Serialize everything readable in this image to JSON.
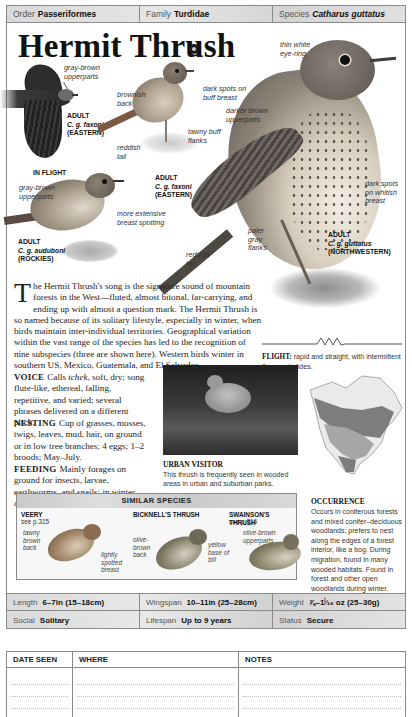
{
  "taxonomy": {
    "order_label": "Order",
    "order_value": "Passeriformes",
    "family_label": "Family",
    "family_value": "Turdidae",
    "species_label": "Species",
    "species_value": "Catharus guttatus"
  },
  "title": "Hermit Thrush",
  "audio_icon": "audio-speaker-icon",
  "illustrations": {
    "flying": {
      "annotations": [
        "gray-brown upperparts"
      ],
      "caption_line1": "ADULT",
      "caption_line2": "C. g. faxoni",
      "caption_line3": "(EASTERN)",
      "label": "IN FLIGHT"
    },
    "faxoni_adult": {
      "annotations": [
        "brownish back",
        "dark spots on buff breast",
        "tawny buff flanks",
        "reddish tail"
      ],
      "caption_line1": "ADULT",
      "caption_line2": "C. g. faxoni",
      "caption_line3": "(EASTERN)"
    },
    "auduboni_adult": {
      "annotations": [
        "gray-brown upperparts",
        "more extensive breast spotting"
      ],
      "caption_line1": "ADULT",
      "caption_line2": "C. g. auduboni",
      "caption_line3": "(ROCKIES)"
    },
    "guttatus_adult": {
      "annotations": [
        "thin white eye-ring",
        "darker brown upperparts",
        "dark spots on whitish breast",
        "paler gray flanks",
        "reddish tail"
      ],
      "caption_line1": "ADULT",
      "caption_line2": "C. g. guttatus",
      "caption_line3": "(NORTHWESTERN)"
    }
  },
  "description": {
    "dropcap": "T",
    "text": "he Hermit Thrush's song is the signature sound of mountain forests in the West—fluted, almost bitonal, far-carrying, and ending up with almost a question mark. The Hermit Thrush is so named because of its solitary lifestyle, especially in winter, when birds maintain inter-individual territories. Geographical variation within the vast range of the species has led to the recognition of nine subspecies (three are shown here). Western birds winter in southern US, Mexico, Guatemala, and El Salvador."
  },
  "sections": {
    "voice": {
      "heading": "VOICE",
      "text_pre": "Calls ",
      "text_em": "tchek",
      "text_post": ", soft, dry; song flute-like, ethereal, falling, repetitive, and varied; several phrases delivered on a different pitch."
    },
    "nesting": {
      "heading": "NESTING",
      "text": "Cup of grasses, mosses, twigs, leaves, mud, hair, on ground or in low tree branches; 4 eggs; 1–2 broods; May–July."
    },
    "feeding": {
      "heading": "FEEDING",
      "text": "Mainly forages on ground for insects, larvae, earthworms, and snails; in winter, also eats fruit."
    }
  },
  "flight": {
    "heading": "FLIGHT:",
    "text": "rapid and straight, with intermittent flaps and glides."
  },
  "urban_visitor": {
    "title": "URBAN VISITOR",
    "text": "This thrush is frequently seen in wooded areas in urban and suburban parks."
  },
  "occurrence": {
    "title": "OCCURRENCE",
    "text": "Occurs in coniferous forests and mixed conifer–deciduous woodlands; prefers to nest along the edges of a forest interior, like a bog. During migration, found in many wooded habitats. Found in forest and other open woodlands during winter."
  },
  "similar_species": {
    "heading": "SIMILAR SPECIES",
    "items": [
      {
        "name": "VEERY",
        "ref": "see p.315",
        "annotations": [
          "tawny brown back",
          "lightly spotted breast"
        ]
      },
      {
        "name": "BICKNELL'S THRUSH",
        "ref": "",
        "annotations": [
          "olive-brown back",
          "yellow base of bill"
        ]
      },
      {
        "name": "SWAINSON'S THRUSH",
        "ref": "see p.316",
        "annotations": [
          "olive-brown upperparts"
        ]
      }
    ]
  },
  "stats": {
    "length_label": "Length",
    "length_value": "6–7in (15–18cm)",
    "wingspan_label": "Wingspan",
    "wingspan_value": "10–11in (25–28cm)",
    "weight_label": "Weight",
    "weight_value": "⅞–1ⁱ⁄₁₆ oz (25–30g)",
    "social_label": "Social",
    "social_value": "Solitary",
    "lifespan_label": "Lifespan",
    "lifespan_value": "Up to 9 years",
    "status_label": "Status",
    "status_value": "Secure"
  },
  "log_table": {
    "headers": [
      "DATE SEEN",
      "WHERE",
      "NOTES"
    ]
  }
}
